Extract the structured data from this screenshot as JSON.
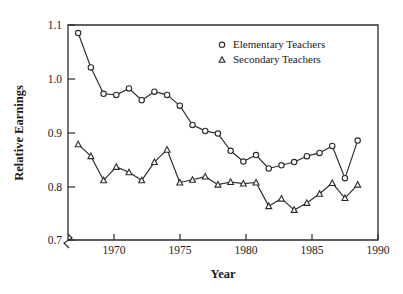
{
  "chart_data": {
    "type": "line",
    "title": "",
    "xlabel": "Year",
    "ylabel": "Relative Earnings",
    "xlim": [
      1966.2,
      1990.6
    ],
    "ylim": [
      0.7,
      1.1
    ],
    "xticks": [
      "1970",
      "1975",
      "1980",
      "1985",
      "1990"
    ],
    "xtick_values": [
      1970,
      1975,
      1980,
      1985,
      1990
    ],
    "yticks": [
      "0.7",
      "0.8",
      "0.9",
      "1.0",
      "1.1"
    ],
    "ytick_values": [
      0.7,
      0.8,
      0.9,
      1.0,
      1.1
    ],
    "grid": false,
    "axis_break": "y-axis broken below 0.70 near origin",
    "legend_position": "upper right inside axes",
    "x": [
      1967,
      1968,
      1969,
      1970,
      1971,
      1972,
      1973,
      1974,
      1975,
      1976,
      1977,
      1978,
      1979,
      1980,
      1981,
      1982,
      1983,
      1984,
      1985,
      1986,
      1987,
      1988,
      1989
    ],
    "series": [
      {
        "name": "Elementary Teachers",
        "marker": "circle",
        "values": [
          1.085,
          1.021,
          0.972,
          0.97,
          0.982,
          0.96,
          0.976,
          0.97,
          0.95,
          0.914,
          0.903,
          0.898,
          0.866,
          0.846,
          0.858,
          0.833,
          0.839,
          0.845,
          0.856,
          0.862,
          0.875,
          0.815,
          0.885
        ]
      },
      {
        "name": "Secondary Teachers",
        "marker": "triangle",
        "values": [
          0.878,
          0.856,
          0.811,
          0.836,
          0.826,
          0.811,
          0.845,
          0.868,
          0.807,
          0.812,
          0.818,
          0.803,
          0.808,
          0.805,
          0.807,
          0.763,
          0.777,
          0.756,
          0.769,
          0.786,
          0.806,
          0.778,
          0.803
        ]
      }
    ]
  },
  "legend": {
    "items": [
      {
        "label": "Elementary Teachers",
        "marker": "circle"
      },
      {
        "label": "Secondary Teachers",
        "marker": "triangle"
      }
    ]
  },
  "colors": {
    "ink": "#2b2b2b",
    "background": "#ffffff",
    "marker_fill": "#ffffff"
  }
}
